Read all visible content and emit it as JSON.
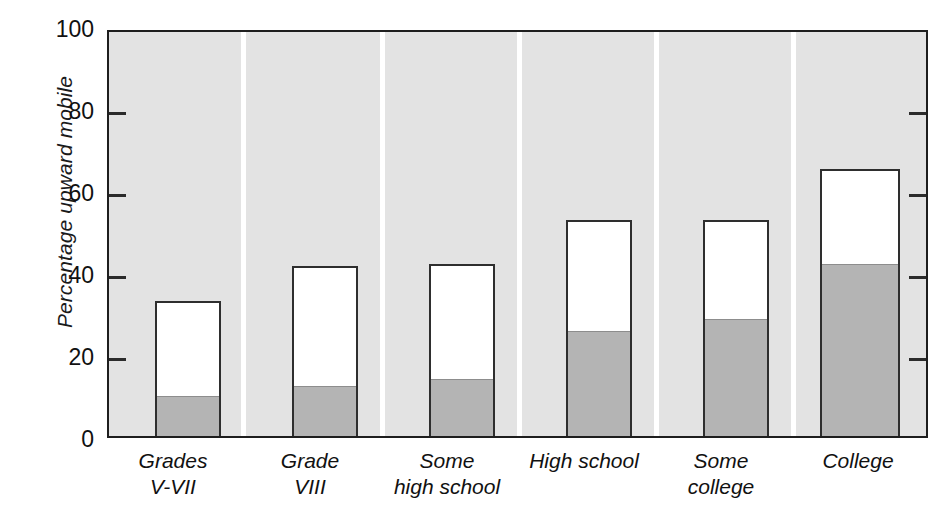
{
  "chart_data": {
    "type": "bar",
    "title": "",
    "subtitle": "",
    "xlabel": "",
    "ylabel": "Percentage upward mobile",
    "ylim": [
      0,
      100
    ],
    "yticks": [
      0,
      20,
      40,
      60,
      80,
      100
    ],
    "ytick_labels": [
      "0",
      "20",
      "40",
      "60",
      "80",
      "100"
    ],
    "grid": false,
    "legend": false,
    "legend_position": "none",
    "stacked": true,
    "categories": [
      "Grades V-VII",
      "Grade VIII",
      "Some high school",
      "High school",
      "Some college",
      "College"
    ],
    "category_lines": [
      [
        "Grades",
        "V-VII"
      ],
      [
        "Grade",
        "VIII"
      ],
      [
        "Some",
        "high school"
      ],
      [
        "High school",
        ""
      ],
      [
        "Some",
        "college"
      ],
      [
        "College",
        ""
      ]
    ],
    "series": [
      {
        "name": "lower segment",
        "color": "#b4b4b4",
        "values": [
          10,
          12.5,
          14,
          26,
          29,
          42.5
        ]
      },
      {
        "name": "total",
        "color": "#ffffff",
        "values": [
          33.5,
          42,
          42.5,
          53.5,
          53.5,
          66
        ]
      }
    ],
    "values": [
      33.5,
      42,
      42.5,
      53.5,
      53.5,
      66
    ],
    "annotations": []
  },
  "axis": {
    "y_title": "Percentage upward mobile",
    "tick_labels": [
      "100",
      "80",
      "60",
      "40",
      "20",
      "0"
    ]
  },
  "colors": {
    "plot_background": "#e3e3e3",
    "bar_fill_upper": "#ffffff",
    "bar_fill_lower": "#b4b4b4",
    "bar_outline": "#2e2e2e",
    "axis_line": "#1e1e1e",
    "separator": "#ffffff",
    "text": "#111111"
  }
}
